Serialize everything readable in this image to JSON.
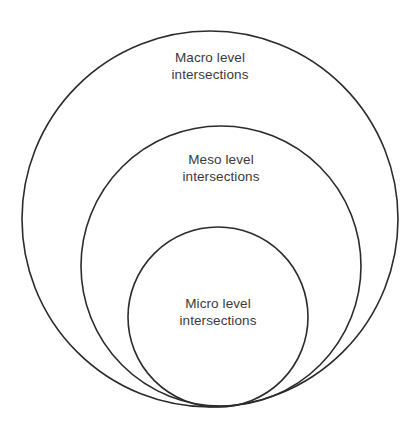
{
  "diagram": {
    "type": "nested-circles",
    "background_color": "#ffffff",
    "stroke_color": "#2b2b2b",
    "text_color": "#3a3a3a",
    "rings": [
      {
        "id": "macro",
        "label_line1": "Macro level",
        "label_line2": "intersections",
        "cx": 210,
        "cy": 219,
        "r": 188
      },
      {
        "id": "meso",
        "label_line1": "Meso level",
        "label_line2": "intersections",
        "cx": 221,
        "cy": 266,
        "r": 140
      },
      {
        "id": "micro",
        "label_line1": "Micro level",
        "label_line2": "intersections",
        "cx": 218,
        "cy": 317,
        "r": 90
      }
    ]
  },
  "chart_data": {
    "type": "diagram",
    "subtype": "concentric-bottom-tangent-circles",
    "categories": [
      "Macro level intersections",
      "Meso level intersections",
      "Micro level intersections"
    ],
    "values": [
      188,
      140,
      90
    ],
    "value_meaning": "circle radius in pixels",
    "nesting_order": [
      "macro",
      "meso",
      "micro"
    ],
    "tangency": "all three circles share a common tangent point at the bottom",
    "legend": "none",
    "grid": false
  }
}
